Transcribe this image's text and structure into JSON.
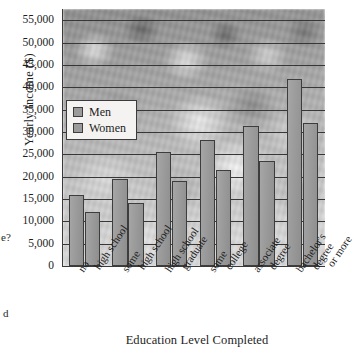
{
  "chart_data": {
    "type": "bar",
    "title": "",
    "xlabel": "Education Level Completed",
    "ylabel": "Yearly Income ($)",
    "ylim": [
      0,
      57500
    ],
    "yticks": [
      "0",
      "5,000",
      "10,000",
      "15,000",
      "20,000",
      "25,000",
      "30,000",
      "35,000",
      "40,000",
      "45,000",
      "50,000",
      "55,000"
    ],
    "ytick_values": [
      0,
      5000,
      10000,
      15000,
      20000,
      25000,
      30000,
      35000,
      40000,
      45000,
      50000,
      55000
    ],
    "grid": true,
    "legend_position": "upper left",
    "categories": [
      [
        "no",
        "high school"
      ],
      [
        "some",
        "high school"
      ],
      [
        "high school",
        "graduate"
      ],
      [
        "some",
        "college"
      ],
      [
        "associate",
        "degree"
      ],
      [
        "bachelor's",
        "degree",
        "or more"
      ]
    ],
    "series": [
      {
        "name": "Men",
        "values": [
          15800,
          19400,
          25500,
          28100,
          31400,
          41900
        ]
      },
      {
        "name": "Women",
        "values": [
          12000,
          14200,
          19000,
          21400,
          23600,
          32100
        ]
      }
    ],
    "colors": {
      "bar_fill": "#9b9b9b",
      "bar_stroke": "#3d3d3d",
      "gridline": "#37373a",
      "axis": "#3a3a3a",
      "legend_background": "#f4f3f1",
      "text": "#1d1d1d"
    }
  },
  "legend": {
    "items": [
      {
        "label": "Men"
      },
      {
        "label": "Women"
      }
    ]
  },
  "page_fragments": {
    "question_tail": "e?",
    "word_tail": "d"
  }
}
